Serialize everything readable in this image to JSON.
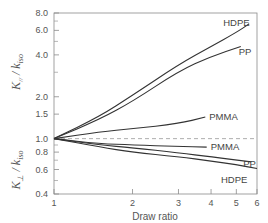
{
  "chart_data": {
    "type": "line",
    "title": "",
    "xlabel": "Draw ratio",
    "ylabel_upper": "K∥ / k_iso",
    "ylabel_lower": "K⊥ / k_iso",
    "xscale": "log",
    "yscale": "log",
    "xlim": [
      1,
      6
    ],
    "ylim": [
      0.4,
      8.0
    ],
    "x_ticks": [
      1,
      2,
      3,
      4,
      5,
      6
    ],
    "x_tick_labels": [
      "1",
      "2",
      "3",
      "4",
      "5",
      "6"
    ],
    "y_ticks": [
      0.4,
      0.6,
      0.8,
      1.0,
      1.5,
      2.0,
      4.0,
      6.0,
      8.0
    ],
    "y_tick_labels": [
      "0.4",
      "0.6",
      "0.8",
      "1.0",
      "1.5",
      "2.0",
      "4.0",
      "6.0",
      "8.0"
    ],
    "y_minor_ticks": [
      0.5,
      0.7,
      0.9,
      3.0,
      5.0,
      7.0
    ],
    "reference_line": {
      "y": 1.0,
      "style": "dashed"
    },
    "grid": false,
    "legend": "inline labels at curve ends",
    "series": [
      {
        "name": "HDPE",
        "component": "parallel",
        "x": [
          1,
          1.5,
          2,
          3,
          4,
          5,
          5.6
        ],
        "y": [
          1.0,
          1.45,
          2.05,
          3.4,
          4.6,
          5.8,
          6.7
        ]
      },
      {
        "name": "PP",
        "component": "parallel",
        "x": [
          1,
          1.5,
          2,
          3,
          4,
          5.2
        ],
        "y": [
          1.0,
          1.38,
          1.85,
          3.05,
          3.9,
          4.6
        ]
      },
      {
        "name": "PMMA",
        "component": "parallel",
        "x": [
          1,
          1.5,
          2,
          3,
          3.8
        ],
        "y": [
          1.0,
          1.12,
          1.18,
          1.28,
          1.43
        ]
      },
      {
        "name": "PMMA",
        "component": "perpendicular",
        "x": [
          1,
          1.5,
          2,
          3,
          3.85
        ],
        "y": [
          1.0,
          0.92,
          0.9,
          0.88,
          0.87
        ]
      },
      {
        "name": "PP",
        "component": "perpendicular",
        "x": [
          1,
          1.5,
          2,
          3,
          4,
          5.7
        ],
        "y": [
          1.0,
          0.9,
          0.86,
          0.79,
          0.74,
          0.68
        ]
      },
      {
        "name": "HDPE",
        "component": "perpendicular",
        "x": [
          1,
          1.5,
          2,
          3,
          4,
          5,
          6
        ],
        "y": [
          1.0,
          0.87,
          0.8,
          0.74,
          0.69,
          0.65,
          0.61
        ]
      }
    ]
  },
  "labels": {
    "x_axis_title": "Draw ratio",
    "series_labels": [
      "HDPE",
      "PP",
      "PMMA",
      "PMMA",
      "PP",
      "HDPE"
    ]
  }
}
